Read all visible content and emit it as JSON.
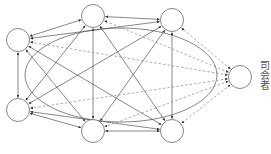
{
  "diagram": {
    "moderator_label": "司会者",
    "colors": {
      "line": "#555555",
      "dashed": "#888888",
      "node_stroke": "#666666",
      "background": "#ffffff"
    },
    "nodes": [
      {
        "id": "A",
        "role": "participant",
        "x": 93,
        "y": 16
      },
      {
        "id": "B",
        "role": "participant",
        "x": 172,
        "y": 20
      },
      {
        "id": "C",
        "role": "participant",
        "x": 18,
        "y": 40
      },
      {
        "id": "D",
        "role": "participant",
        "x": 18,
        "y": 110
      },
      {
        "id": "E",
        "role": "participant",
        "x": 93,
        "y": 131
      },
      {
        "id": "F",
        "role": "participant",
        "x": 172,
        "y": 131
      },
      {
        "id": "M",
        "role": "moderator",
        "x": 240,
        "y": 77
      }
    ],
    "solid_edges": [
      [
        "A",
        "B"
      ],
      [
        "A",
        "C"
      ],
      [
        "A",
        "D"
      ],
      [
        "A",
        "E"
      ],
      [
        "A",
        "F"
      ],
      [
        "B",
        "C"
      ],
      [
        "B",
        "D"
      ],
      [
        "B",
        "E"
      ],
      [
        "B",
        "F"
      ],
      [
        "C",
        "D"
      ],
      [
        "C",
        "E"
      ],
      [
        "C",
        "F"
      ],
      [
        "D",
        "E"
      ],
      [
        "D",
        "F"
      ],
      [
        "E",
        "F"
      ]
    ],
    "dashed_edges": [
      [
        "M",
        "A"
      ],
      [
        "M",
        "B"
      ],
      [
        "M",
        "C"
      ],
      [
        "M",
        "D"
      ],
      [
        "M",
        "E"
      ],
      [
        "M",
        "F"
      ]
    ],
    "ellipse": {
      "cx": 121,
      "cy": 75,
      "rx": 96,
      "ry": 47
    }
  }
}
